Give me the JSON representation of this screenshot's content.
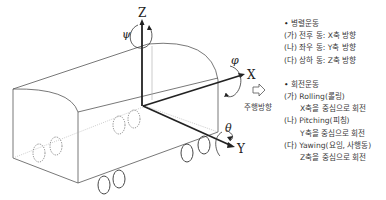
{
  "diagram": {
    "axes": {
      "z_label": "Z",
      "x_label": "X",
      "y_label": "Y",
      "yaw_symbol": "ψ",
      "roll_symbol": "φ",
      "pitch_symbol": "θ"
    },
    "travel_direction_label": "주행방향"
  },
  "legend": {
    "translation": {
      "title": "병렬운동",
      "items": [
        "(가) 전후 동: X축 방향",
        "(나) 좌우 동: Y축 방향",
        "(다) 상하 동: Z축 방향"
      ]
    },
    "rotation": {
      "title": "회전운동",
      "items": [
        {
          "name": "(가) Rolling(롤링)",
          "desc": "X축을 중심으로 회전"
        },
        {
          "name": "(나) Pitching(피칭)",
          "desc": "Y축을 중심으로 회전"
        },
        {
          "name": "(다) Yawing(요잉, 사행동)",
          "desc": "Z축을 중심으로 회전"
        }
      ]
    }
  }
}
